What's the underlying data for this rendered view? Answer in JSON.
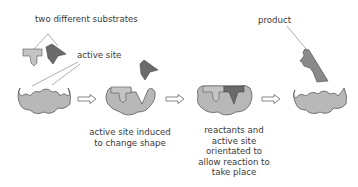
{
  "diagram": {
    "colors": {
      "enzyme_fill": "#b8b8b8",
      "enzyme_stroke": "#4a4a4a",
      "substrate_light": "#c4c4c4",
      "substrate_dark": "#6a6a6a",
      "arrow_fill": "#ffffff",
      "arrow_stroke": "#555555",
      "text": "#3a3a3a"
    },
    "labels": {
      "two_substrates": "two different substrates",
      "active_site": "active site",
      "product": "product",
      "step2_line1": "active site induced",
      "step2_line2": "to change shape",
      "step3_line1": "reactants and",
      "step3_line2": "active site",
      "step3_line3": "orientated to",
      "step3_line4": "allow reaction to",
      "step3_line5": "take place"
    },
    "stages": [
      {
        "id": "enzyme-with-free-substrates",
        "arrow_after": true
      },
      {
        "id": "enzyme-binding-first-substrate",
        "arrow_after": true
      },
      {
        "id": "enzyme-substrate-complex",
        "arrow_after": true
      },
      {
        "id": "enzyme-releasing-product",
        "arrow_after": false
      }
    ]
  }
}
